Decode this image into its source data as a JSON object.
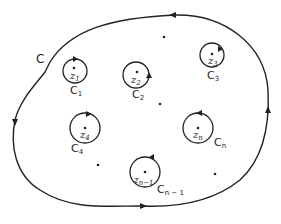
{
  "diagram": {
    "outer_contour": {
      "label": "C",
      "orientation": "counterclockwise"
    },
    "inner_contours": [
      {
        "label": "C",
        "sub": "1",
        "point": "z",
        "point_sub": "1"
      },
      {
        "label": "C",
        "sub": "2",
        "point": "z",
        "point_sub": "2"
      },
      {
        "label": "C",
        "sub": "3",
        "point": "z",
        "point_sub": "3"
      },
      {
        "label": "C",
        "sub": "4",
        "point": "z",
        "point_sub": "4"
      },
      {
        "label": "C",
        "sub": "n",
        "point": "z",
        "point_sub": "n"
      },
      {
        "label": "C",
        "sub": "n − 1",
        "point": "z",
        "point_sub": "n−1"
      }
    ],
    "colors": {
      "stroke": "#222222",
      "background": "#ffffff"
    }
  }
}
